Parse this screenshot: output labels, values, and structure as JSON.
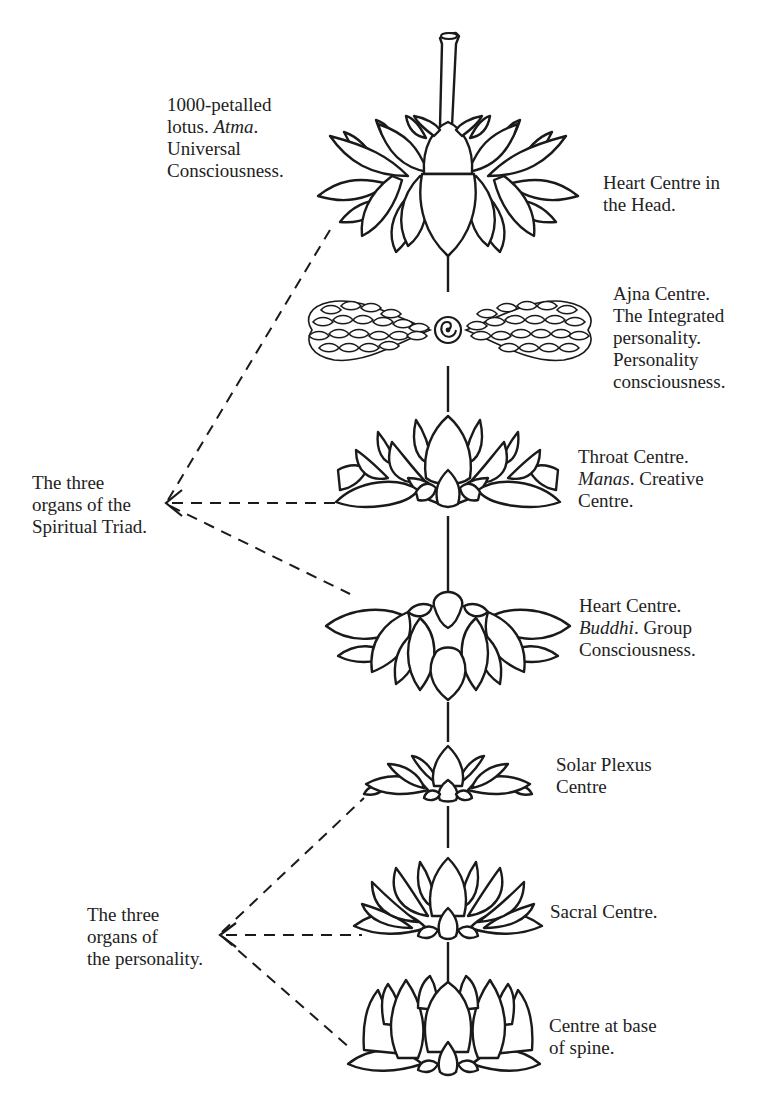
{
  "diagram": {
    "centres": [
      {
        "id": "head",
        "lines": [
          "Heart Centre in",
          "the Head."
        ]
      },
      {
        "id": "ajna",
        "lines": [
          "Ajna Centre.",
          "The Integrated",
          "personality.",
          "Personality",
          "consciousness."
        ]
      },
      {
        "id": "throat",
        "lines": [
          "Throat Centre.",
          "{Manas}. Creative",
          "Centre."
        ],
        "line1_italic": "Manas",
        "line1_rest": ". Creative"
      },
      {
        "id": "heart",
        "line0": "Heart Centre.",
        "line1_italic": "Buddhi",
        "line1_rest": ". Group",
        "line2": "Consciousness."
      },
      {
        "id": "solar",
        "lines": [
          "Solar Plexus",
          "Centre"
        ]
      },
      {
        "id": "sacral",
        "lines": [
          "Sacral Centre."
        ]
      },
      {
        "id": "base",
        "lines": [
          "Centre at base",
          "of spine."
        ]
      }
    ],
    "throat": {
      "line0": "Throat Centre.",
      "line1_italic": "Manas",
      "line1_rest": ". Creative",
      "line2": "Centre."
    },
    "heart": {
      "line0": "Heart Centre.",
      "line1_italic": "Buddhi",
      "line1_rest": ". Group",
      "line2": "Consciousness."
    },
    "head": {
      "line0": "Heart Centre in",
      "line1": "the Head."
    },
    "ajna": {
      "line0": "Ajna Centre.",
      "line1": "The Integrated",
      "line2": "personality.",
      "line3": "Personality",
      "line4": "consciousness."
    },
    "solar": {
      "line0": "Solar Plexus",
      "line1": "Centre"
    },
    "sacral": {
      "line0": "Sacral Centre."
    },
    "base": {
      "line0": "Centre at base",
      "line1": "of spine."
    },
    "lotus_1000": {
      "line0": "1000-petalled",
      "line1_pre": "lotus. ",
      "line1_italic": "Atma",
      "line1_post": ".",
      "line2": "Universal",
      "line3": "Consciousness."
    },
    "groups": {
      "spiritual_triad": {
        "line0": "The three",
        "line1": "organs of the",
        "line2": "Spiritual Triad.",
        "connects": [
          "head",
          "throat",
          "heart"
        ]
      },
      "personality": {
        "line0": "The three",
        "line1": "organs of",
        "line2": "the personality.",
        "connects": [
          "solar",
          "sacral",
          "base"
        ]
      }
    }
  }
}
